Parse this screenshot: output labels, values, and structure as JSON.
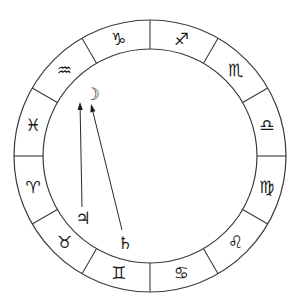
{
  "wheel": {
    "center": [
      150,
      156
    ],
    "outer_radius": 136,
    "inner_radius": 107,
    "glyph_radius": 121,
    "line_color": "#3a3a3a",
    "signs": [
      {
        "name": "sagittarius",
        "glyph": "♐",
        "angle": 15
      },
      {
        "name": "scorpio",
        "glyph": "♏",
        "angle": 45
      },
      {
        "name": "libra",
        "glyph": "♎",
        "angle": 75
      },
      {
        "name": "virgo",
        "glyph": "♍",
        "angle": 105
      },
      {
        "name": "leo",
        "glyph": "♌",
        "angle": 135
      },
      {
        "name": "cancer",
        "glyph": "♋",
        "angle": 165
      },
      {
        "name": "gemini",
        "glyph": "♊",
        "angle": 195
      },
      {
        "name": "taurus",
        "glyph": "♉",
        "angle": 225
      },
      {
        "name": "aries",
        "glyph": "♈",
        "angle": 255
      },
      {
        "name": "pisces",
        "glyph": "♓",
        "angle": 285
      },
      {
        "name": "aquarius",
        "glyph": "♒",
        "angle": 315
      },
      {
        "name": "capricorn",
        "glyph": "♑",
        "angle": 345
      }
    ]
  },
  "planets": [
    {
      "name": "moon",
      "glyph": "☽",
      "pos": [
        92,
        94
      ]
    },
    {
      "name": "jupiter",
      "glyph": "♃",
      "pos": [
        83,
        218
      ]
    },
    {
      "name": "saturn",
      "glyph": "♄",
      "pos": [
        125,
        243
      ]
    }
  ],
  "arrows": [
    {
      "name": "jupiter-to-moon",
      "from": [
        82,
        207
      ],
      "to": [
        80,
        102
      ]
    },
    {
      "name": "saturn-to-moon",
      "from": [
        122,
        230
      ],
      "to": [
        91,
        104
      ]
    }
  ]
}
